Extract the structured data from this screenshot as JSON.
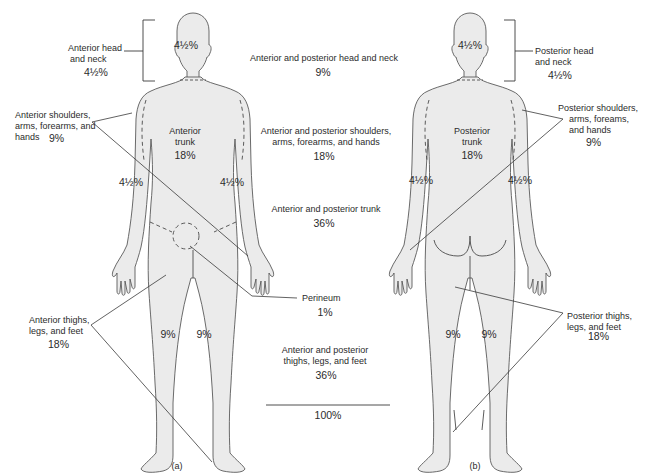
{
  "figure": {
    "panels": [
      {
        "id": "a",
        "caption": "(a)",
        "view": "anterior"
      },
      {
        "id": "b",
        "caption": "(b)",
        "view": "posterior"
      }
    ],
    "colors": {
      "body_fill": "#ebebeb",
      "outline": "#5a5a5a",
      "leader_line": "#3a3a3a",
      "text": "#2b2b2b",
      "background": "#ffffff"
    }
  },
  "anterior_labels": {
    "head_neck": {
      "line1": "Anterior head",
      "line2": "and neck",
      "value": "4½%"
    },
    "shoulders_arms": {
      "line1": "Anterior shoulders,",
      "line2": "arms, forearms, and",
      "line3": "hands",
      "value": "9%"
    },
    "thighs_legs": {
      "line1": "Anterior thighs,",
      "line2": "legs, and feet",
      "value": "18%"
    }
  },
  "anterior_body_values": {
    "head": "4½%",
    "trunk_line1": "Anterior",
    "trunk_line2": "trunk",
    "trunk_value": "18%",
    "left_arm": "4½%",
    "right_arm": "4½%",
    "left_leg": "9%",
    "right_leg": "9%"
  },
  "center_summary": {
    "head_neck": {
      "label": "Anterior and posterior head and neck",
      "value": "9%"
    },
    "shoulders_arms": {
      "line1": "Anterior and posterior shoulders,",
      "line2": "arms, forearms, and hands",
      "value": "18%"
    },
    "trunk": {
      "label": "Anterior and posterior trunk",
      "value": "36%"
    },
    "perineum": {
      "label": "Perineum",
      "value": "1%"
    },
    "thighs_legs": {
      "line1": "Anterior and posterior",
      "line2": "thighs, legs, and feet",
      "value": "36%"
    },
    "total": "100%"
  },
  "posterior_labels": {
    "head_neck": {
      "line1": "Posterior head",
      "line2": "and neck",
      "value": "4½%"
    },
    "shoulders_arms": {
      "line1": "Posterior shoulders,",
      "line2": "arms, foreams,",
      "line3": "and hands",
      "value": "9%"
    },
    "thighs_legs": {
      "line1": "Posterior thighs,",
      "line2": "legs, and feet",
      "value": "18%"
    }
  },
  "posterior_body_values": {
    "head": "4½%",
    "trunk_line1": "Posterior",
    "trunk_line2": "trunk",
    "trunk_value": "18%",
    "left_arm": "4½%",
    "right_arm": "4½%",
    "left_leg": "9%",
    "right_leg": "9%"
  }
}
